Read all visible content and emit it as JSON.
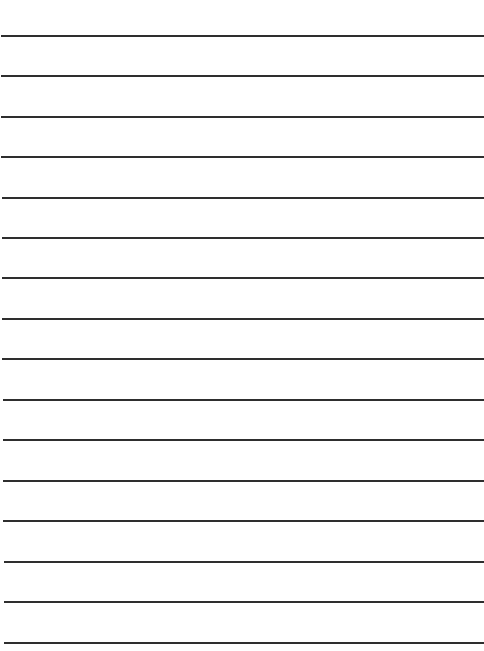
{
  "page": {
    "type": "lined-paper",
    "background_color": "#ffffff",
    "line_color": "#2e2e2e",
    "line_count": 16,
    "lines": [
      {
        "y": 35,
        "x_start": 1
      },
      {
        "y": 75,
        "x_start": 1
      },
      {
        "y": 116,
        "x_start": 1
      },
      {
        "y": 156,
        "x_start": 1
      },
      {
        "y": 197,
        "x_start": 2
      },
      {
        "y": 237,
        "x_start": 2
      },
      {
        "y": 277,
        "x_start": 2
      },
      {
        "y": 318,
        "x_start": 2
      },
      {
        "y": 358,
        "x_start": 2
      },
      {
        "y": 399,
        "x_start": 3
      },
      {
        "y": 439,
        "x_start": 3
      },
      {
        "y": 480,
        "x_start": 3
      },
      {
        "y": 520,
        "x_start": 3
      },
      {
        "y": 561,
        "x_start": 4
      },
      {
        "y": 601,
        "x_start": 4
      },
      {
        "y": 642,
        "x_start": 4
      }
    ]
  }
}
